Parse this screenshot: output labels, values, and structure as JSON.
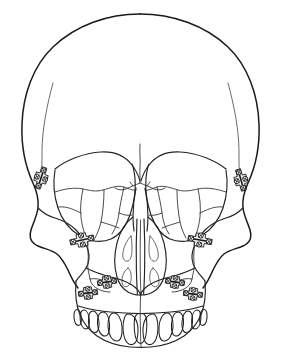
{
  "figure": {
    "view": "anterior",
    "background_color": "#ffffff",
    "line_color": "#1a1a1a",
    "fracture_line_color": "#2b2b2b",
    "hardware_color": "#171717",
    "plate_fill_color": "#f2f2f2",
    "width_px": 281,
    "height_px": 363,
    "style": "black-and-white line drawing"
  },
  "anatomy": {
    "regions": [
      {
        "id": "cranial-vault",
        "label": "Cranial vault / frontal bone"
      },
      {
        "id": "temporal-line-left",
        "label": "Left temporal line"
      },
      {
        "id": "temporal-line-right",
        "label": "Right temporal line"
      },
      {
        "id": "orbit-left",
        "label": "Left orbit"
      },
      {
        "id": "orbit-right",
        "label": "Right orbit"
      },
      {
        "id": "nasal-aperture",
        "label": "Piriform (nasal) aperture"
      },
      {
        "id": "nasal-septum",
        "label": "Nasal septum / vomer"
      },
      {
        "id": "turbinate-left",
        "label": "Left nasal conchae"
      },
      {
        "id": "turbinate-right",
        "label": "Right nasal conchae"
      },
      {
        "id": "zygoma-left",
        "label": "Left zygomatic bone"
      },
      {
        "id": "zygoma-right",
        "label": "Right zygomatic bone"
      },
      {
        "id": "maxilla",
        "label": "Maxilla"
      },
      {
        "id": "alveolar-arch",
        "label": "Maxillary alveolar arch"
      }
    ],
    "teeth": {
      "label": "Maxillary dentition",
      "count": 14
    }
  },
  "hardware": {
    "label": "Titanium bone plates and screws",
    "plate_count": 8,
    "plates": [
      {
        "id": "plate-left-lateral-orbital-rim",
        "label": "Left lateral orbital rim plate",
        "x": 41,
        "y": 178,
        "rotation": -72,
        "screws": 4
      },
      {
        "id": "plate-right-lateral-orbital-rim",
        "label": "Right lateral orbital rim plate",
        "x": 241,
        "y": 180,
        "rotation": 74,
        "screws": 4
      },
      {
        "id": "plate-left-infraorbital",
        "label": "Left infraorbital rim plate",
        "x": 82,
        "y": 240,
        "rotation": -12,
        "screws": 4
      },
      {
        "id": "plate-right-infraorbital",
        "label": "Right infraorbital rim plate",
        "x": 200,
        "y": 240,
        "rotation": 10,
        "screws": 4
      },
      {
        "id": "plate-left-buttress-upper",
        "label": "Left zygomaticomaxillary buttress plate",
        "x": 107,
        "y": 282,
        "rotation": -8,
        "screws": 4
      },
      {
        "id": "plate-left-buttress-lower",
        "label": "Left maxillary buttress plate",
        "x": 88,
        "y": 293,
        "rotation": -6,
        "screws": 4
      },
      {
        "id": "plate-right-buttress-upper",
        "label": "Right zygomaticomaxillary buttress plate",
        "x": 175,
        "y": 282,
        "rotation": 8,
        "screws": 4
      },
      {
        "id": "plate-right-buttress-lower",
        "label": "Right maxillary buttress plate",
        "x": 193,
        "y": 294,
        "rotation": 6,
        "screws": 4
      }
    ]
  },
  "fractures": {
    "label": "Comminuted facial fracture lines",
    "groups": [
      {
        "id": "fracture-frontal-midline",
        "label": "Frontal midline fracture"
      },
      {
        "id": "fracture-orbit-left",
        "label": "Left orbital floor comminution"
      },
      {
        "id": "fracture-orbit-right",
        "label": "Right orbital floor comminution"
      },
      {
        "id": "fracture-buttress-left",
        "label": "Left vertical buttress fracture"
      },
      {
        "id": "fracture-buttress-right",
        "label": "Right vertical buttress fracture"
      },
      {
        "id": "fracture-maxilla-midline",
        "label": "Midline palatal split"
      }
    ]
  }
}
